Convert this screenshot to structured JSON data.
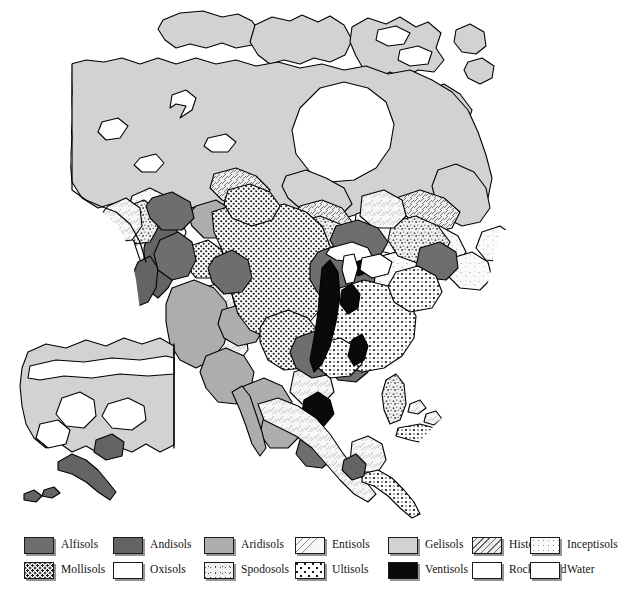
{
  "map": {
    "title": "Soil Orders of North America",
    "regions_described": "Generalized soil order distribution across North America including Alaska inset",
    "background_color": "#ffffff",
    "outline_color": "#000000"
  },
  "legend": {
    "rows": [
      {
        "items": [
          {
            "label": "Alfisols",
            "pattern": "solid-dark-gray",
            "color": "#6e6e6e",
            "x": 28
          },
          {
            "label": "Andisols",
            "pattern": "solid-dark-gray",
            "color": "#6b6b6b",
            "x": 118
          },
          {
            "label": "Aridisols",
            "pattern": "solid-medium-gray",
            "color": "#adadad",
            "x": 208
          },
          {
            "label": "Entisols",
            "pattern": "fine-scratch",
            "color": "#f2f2f2",
            "x": 300
          },
          {
            "label": "Gelisols",
            "pattern": "solid-light-gray",
            "color": "#d2d2d2",
            "x": 394
          },
          {
            "label": "Histosols",
            "pattern": "diagonal-hatch",
            "color": "#e8e8e8",
            "x": 478
          },
          {
            "label": "Inceptisols",
            "pattern": "sparse-stipple",
            "color": "#f4f4f4",
            "x": 536
          }
        ]
      },
      {
        "items": [
          {
            "label": "Mollisols",
            "pattern": "dense-dot",
            "color": "#ffffff",
            "x": 28
          },
          {
            "label": "Oxisols",
            "pattern": "plain-white",
            "color": "#ffffff",
            "x": 118
          },
          {
            "label": "Spodosols",
            "pattern": "coarse-stipple",
            "color": "#ececec",
            "x": 208
          },
          {
            "label": "Ultisols",
            "pattern": "cross-dot",
            "color": "#ffffff",
            "x": 300
          },
          {
            "label": "Ventisols",
            "pattern": "solid-black",
            "color": "#0a0a0a",
            "x": 394
          },
          {
            "label": "Rocky Land",
            "pattern": "plain-white",
            "color": "#ffffff",
            "x": 478
          },
          {
            "label": "Water",
            "pattern": "plain-white",
            "color": "#ffffff",
            "x": 536
          }
        ]
      }
    ]
  },
  "colors": {
    "alfisols": "#6e6e6e",
    "andisols": "#6b6b6b",
    "aridisols": "#adadad",
    "gelisols": "#d2d2d2",
    "ventisols": "#0a0a0a",
    "outline": "#000000",
    "shadow": "#828282"
  }
}
